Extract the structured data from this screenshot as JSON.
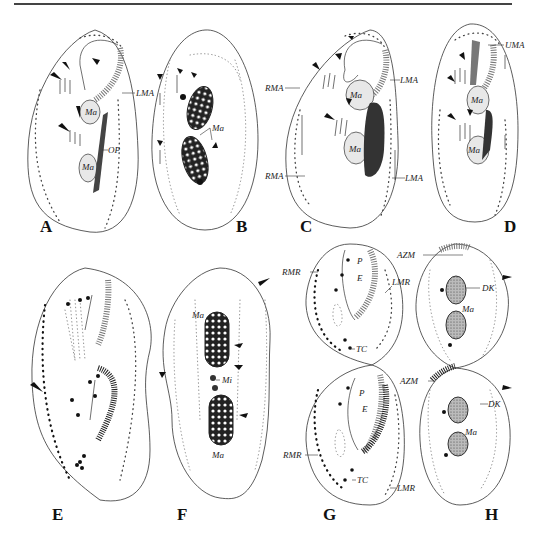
{
  "figure": {
    "top_rule": true,
    "panels": [
      {
        "id": "A",
        "label": "A",
        "annotations": [
          "LMA",
          "Ma",
          "Ma",
          "OP"
        ]
      },
      {
        "id": "B",
        "label": "B",
        "annotations": [
          "Ma"
        ]
      },
      {
        "id": "C",
        "label": "C",
        "annotations": [
          "RMA",
          "LMA",
          "Ma",
          "Ma",
          "RMA",
          "LMA"
        ]
      },
      {
        "id": "D",
        "label": "D",
        "annotations": [
          "UMA",
          "Ma",
          "Ma"
        ]
      },
      {
        "id": "E",
        "label": "E",
        "annotations": []
      },
      {
        "id": "F",
        "label": "F",
        "annotations": [
          "Ma",
          "Mi",
          "Ma"
        ]
      },
      {
        "id": "G",
        "label": "G",
        "annotations": [
          "RMR",
          "P",
          "E",
          "LMR",
          "TC",
          "RMR",
          "P",
          "E",
          "TC",
          "LMR"
        ]
      },
      {
        "id": "H",
        "label": "H",
        "annotations": [
          "AZM",
          "DK",
          "Ma",
          "AZM",
          "DK",
          "Ma"
        ]
      }
    ]
  },
  "labels": {
    "A": "A",
    "B": "B",
    "C": "C",
    "D": "D",
    "E": "E",
    "F": "F",
    "G": "G",
    "H": "H",
    "LMA": "LMA",
    "RMA": "RMA",
    "UMA": "UMA",
    "OP": "OP",
    "Ma": "Ma",
    "Mi": "Mi",
    "RMR": "RMR",
    "LMR": "LMR",
    "AZM": "AZM",
    "DK": "DK",
    "TC": "TC",
    "P": "P",
    "E_struct": "E"
  }
}
